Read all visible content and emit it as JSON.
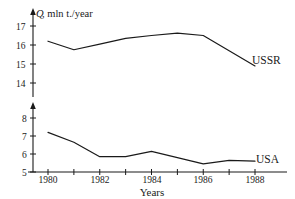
{
  "chart_data": {
    "type": "line",
    "title": "",
    "ylabel": "Q, mln t./year",
    "ylabel_symbol": "Q",
    "ylabel_rest": ", mln  t./year",
    "xlabel": "Years",
    "xlim": [
      1979.4,
      1989.2
    ],
    "x": [
      1980,
      1981,
      1982,
      1983,
      1984,
      1985,
      1986,
      1987,
      1988
    ],
    "xticks_labeled": [
      "1980",
      "1982",
      "1984",
      "1986",
      "1988"
    ],
    "xtick_values": [
      1980,
      1981,
      1982,
      1983,
      1984,
      1985,
      1986,
      1987,
      1988
    ],
    "grid": false,
    "legend_position": "inline-right",
    "panels": [
      {
        "name": "USSR",
        "series_label": "USSR",
        "ylim": [
          13.6,
          17.3
        ],
        "yticks": [
          14,
          15,
          16,
          17
        ],
        "ytick_labels": [
          "14",
          "15",
          "16",
          "17"
        ],
        "values": [
          16.2,
          15.75,
          16.05,
          16.35,
          16.5,
          16.62,
          16.5,
          15.7,
          14.9
        ],
        "units": "mln t./year"
      },
      {
        "name": "USA",
        "series_label": "USA",
        "ylim": [
          5.0,
          8.4
        ],
        "yticks": [
          5,
          6,
          7,
          8
        ],
        "ytick_labels": [
          "5",
          "6",
          "7",
          "8"
        ],
        "values": [
          7.2,
          6.65,
          5.85,
          5.85,
          6.15,
          5.8,
          5.45,
          5.65,
          5.6
        ],
        "units": "mln t./year"
      }
    ]
  }
}
